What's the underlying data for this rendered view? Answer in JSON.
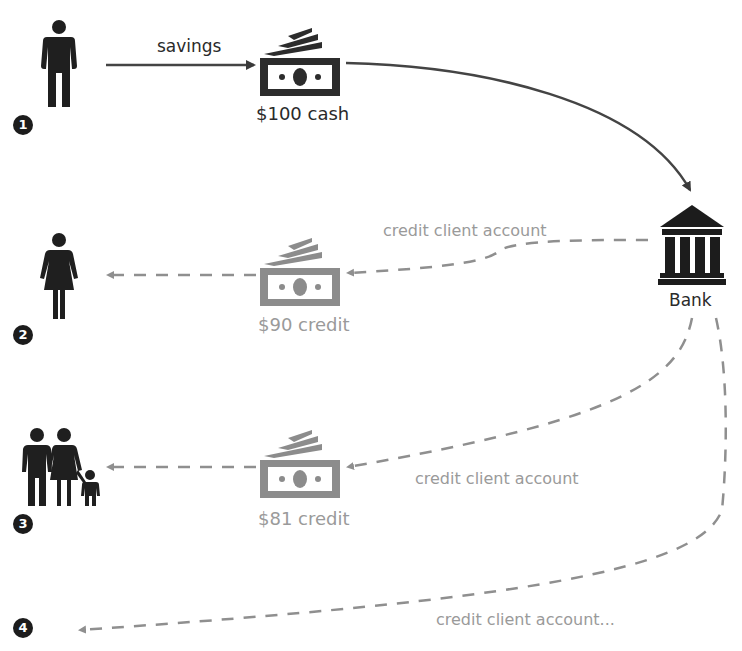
{
  "diagram": {
    "type": "money-multiplier-flow",
    "colors": {
      "primary": "#2a2a2a",
      "secondary": "#9a9a9a",
      "background": "#ffffff"
    },
    "nodes": [
      {
        "id": "step1",
        "badge": "1",
        "icon": "man-icon"
      },
      {
        "id": "step2",
        "badge": "2",
        "icon": "woman-icon"
      },
      {
        "id": "step3",
        "badge": "3",
        "icon": "family-icon"
      },
      {
        "id": "step4",
        "badge": "4",
        "icon": null
      },
      {
        "id": "bank",
        "icon": "bank-icon",
        "label": "Bank"
      }
    ],
    "money": [
      {
        "id": "cash",
        "icon": "banknote-icon",
        "label": "$100 cash",
        "style": "dark"
      },
      {
        "id": "credit90",
        "icon": "banknote-icon",
        "label": "$90 credit",
        "style": "grey"
      },
      {
        "id": "credit81",
        "icon": "banknote-icon",
        "label": "$81 credit",
        "style": "grey"
      }
    ],
    "edges": [
      {
        "from": "step1",
        "to": "cash",
        "label": "savings",
        "style": "solid"
      },
      {
        "from": "cash",
        "to": "bank",
        "label": "",
        "style": "solid"
      },
      {
        "from": "bank",
        "to": "credit90",
        "label": "credit client account",
        "style": "dashed"
      },
      {
        "from": "credit90",
        "to": "step2",
        "label": "",
        "style": "dashed"
      },
      {
        "from": "bank",
        "to": "credit81",
        "label": "credit client account",
        "style": "dashed"
      },
      {
        "from": "credit81",
        "to": "step3",
        "label": "",
        "style": "dashed"
      },
      {
        "from": "bank",
        "to": "step4",
        "label": "credit client account...",
        "style": "dashed"
      }
    ]
  }
}
